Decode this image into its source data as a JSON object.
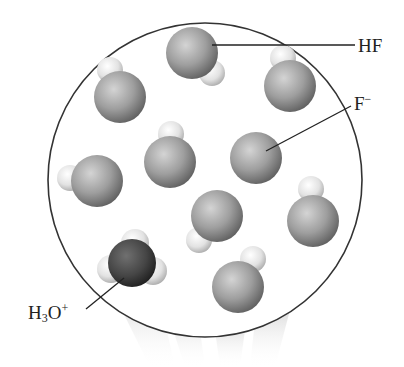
{
  "diagram": {
    "labels": {
      "hf": "HF",
      "fluoride": {
        "base": "F",
        "charge": "−"
      },
      "hydronium": {
        "h": "H",
        "sub": "3",
        "o": "O",
        "charge": "+"
      }
    },
    "colors": {
      "large_atom": "#9a9a9a",
      "small_h_atom": "#e6e6e6",
      "hydronium_oxygen": "#4a4a4a",
      "circle_stroke": "#333333"
    },
    "molecules": [
      {
        "type": "HF",
        "x": 192,
        "y": 53,
        "hx": 212,
        "hy": 73
      },
      {
        "type": "HF",
        "x": 120,
        "y": 97,
        "hx": 110,
        "hy": 70
      },
      {
        "type": "HF",
        "x": 290,
        "y": 86,
        "hx": 283,
        "hy": 58
      },
      {
        "type": "F-",
        "x": 256,
        "y": 158
      },
      {
        "type": "HF",
        "x": 170,
        "y": 162,
        "hx": 171,
        "hy": 134
      },
      {
        "type": "HF",
        "x": 97,
        "y": 181,
        "hx": 70,
        "hy": 178
      },
      {
        "type": "HF",
        "x": 217,
        "y": 216,
        "hx": 199,
        "hy": 240
      },
      {
        "type": "HF",
        "x": 313,
        "y": 221,
        "hx": 311,
        "hy": 189
      },
      {
        "type": "HF",
        "x": 238,
        "y": 287,
        "hx": 253,
        "hy": 259
      },
      {
        "type": "H3O+",
        "x": 132,
        "y": 263
      }
    ]
  }
}
